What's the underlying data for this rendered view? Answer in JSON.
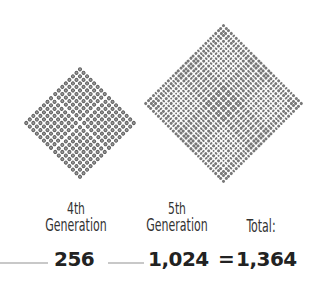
{
  "diagram": {
    "generations": [
      {
        "ordinal": "4th",
        "label": "Generation",
        "count": "256",
        "grid": 16
      },
      {
        "ordinal": "5th",
        "label": "Generation",
        "count": "1,024",
        "grid": 32
      }
    ],
    "total": {
      "label": "Total:",
      "value": "1,364"
    },
    "equals": "=",
    "colors": {
      "dot": "#6b6b6b",
      "text": "#222222",
      "line": "#c8c8c8"
    }
  }
}
